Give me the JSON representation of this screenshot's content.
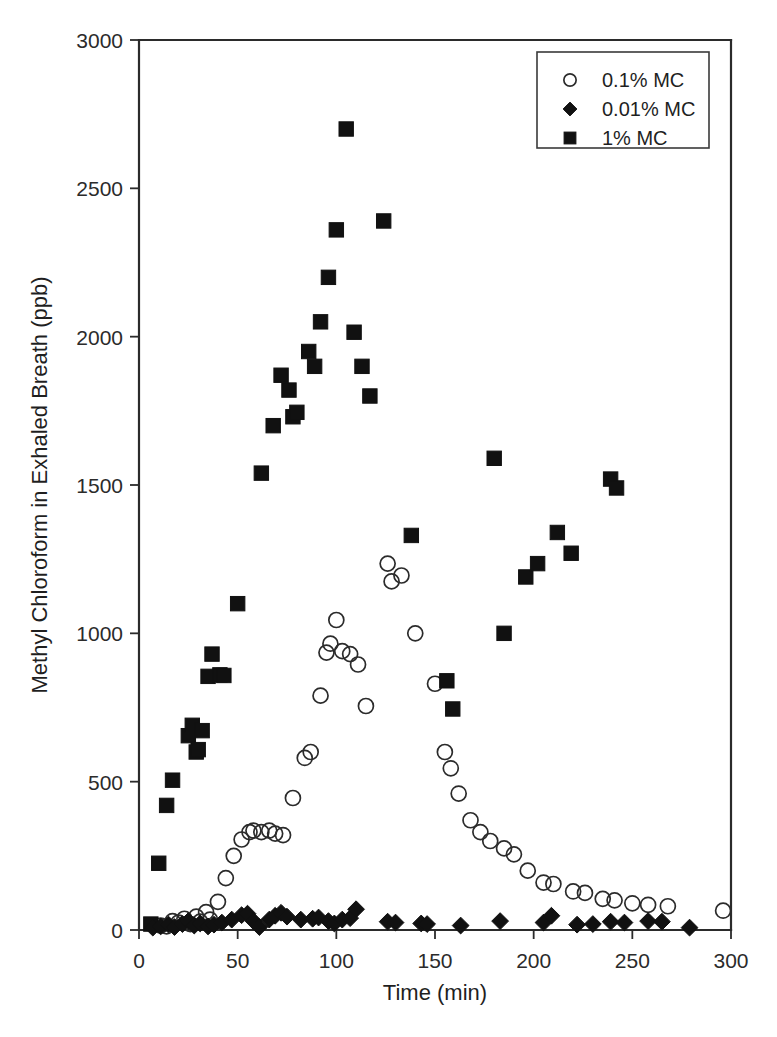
{
  "chart_data": {
    "type": "scatter",
    "title": "",
    "xlabel": "Time (min)",
    "ylabel": "Methyl Chloroform in Exhaled Breath (ppb)",
    "xlim": [
      0,
      300
    ],
    "ylim": [
      0,
      3000
    ],
    "xticks": [
      0,
      50,
      100,
      150,
      200,
      250,
      300
    ],
    "yticks": [
      0,
      500,
      1000,
      1500,
      2000,
      2500,
      3000
    ],
    "xtick_labels": [
      "0",
      "50",
      "100",
      "150",
      "200",
      "250",
      "300"
    ],
    "ytick_labels": [
      "0",
      "500",
      "1000",
      "1500",
      "2000",
      "2500",
      "3000"
    ],
    "grid": false,
    "legend_position": "top-right",
    "series": [
      {
        "name": "0.1% MC",
        "marker": "open-circle",
        "color": "#2b2b2b",
        "points": [
          [
            11,
            15
          ],
          [
            14,
            12
          ],
          [
            17,
            30
          ],
          [
            20,
            25
          ],
          [
            23,
            38
          ],
          [
            26,
            20
          ],
          [
            29,
            45
          ],
          [
            31,
            28
          ],
          [
            34,
            60
          ],
          [
            36,
            35
          ],
          [
            40,
            95
          ],
          [
            44,
            175
          ],
          [
            48,
            250
          ],
          [
            52,
            305
          ],
          [
            56,
            330
          ],
          [
            58,
            335
          ],
          [
            62,
            330
          ],
          [
            66,
            335
          ],
          [
            69,
            325
          ],
          [
            73,
            320
          ],
          [
            78,
            445
          ],
          [
            84,
            580
          ],
          [
            87,
            600
          ],
          [
            92,
            790
          ],
          [
            95,
            935
          ],
          [
            97,
            965
          ],
          [
            100,
            1045
          ],
          [
            103,
            940
          ],
          [
            107,
            930
          ],
          [
            111,
            895
          ],
          [
            115,
            755
          ],
          [
            126,
            1235
          ],
          [
            128,
            1175
          ],
          [
            133,
            1195
          ],
          [
            140,
            1000
          ],
          [
            150,
            830
          ],
          [
            155,
            600
          ],
          [
            158,
            545
          ],
          [
            162,
            460
          ],
          [
            168,
            370
          ],
          [
            173,
            330
          ],
          [
            178,
            300
          ],
          [
            185,
            275
          ],
          [
            190,
            255
          ],
          [
            197,
            200
          ],
          [
            205,
            160
          ],
          [
            210,
            155
          ],
          [
            220,
            130
          ],
          [
            226,
            125
          ],
          [
            235,
            105
          ],
          [
            241,
            100
          ],
          [
            250,
            90
          ],
          [
            258,
            85
          ],
          [
            268,
            80
          ],
          [
            296,
            65
          ]
        ]
      },
      {
        "name": "0.01% MC",
        "marker": "filled-diamond",
        "color": "#111111",
        "points": [
          [
            7,
            8
          ],
          [
            11,
            12
          ],
          [
            15,
            18
          ],
          [
            18,
            10
          ],
          [
            22,
            20
          ],
          [
            25,
            30
          ],
          [
            28,
            15
          ],
          [
            31,
            22
          ],
          [
            35,
            12
          ],
          [
            38,
            18
          ],
          [
            42,
            25
          ],
          [
            47,
            35
          ],
          [
            52,
            50
          ],
          [
            55,
            55
          ],
          [
            58,
            30
          ],
          [
            61,
            10
          ],
          [
            66,
            35
          ],
          [
            69,
            48
          ],
          [
            72,
            58
          ],
          [
            75,
            45
          ],
          [
            82,
            35
          ],
          [
            88,
            38
          ],
          [
            91,
            42
          ],
          [
            96,
            30
          ],
          [
            99,
            22
          ],
          [
            103,
            35
          ],
          [
            107,
            40
          ],
          [
            110,
            70
          ],
          [
            126,
            28
          ],
          [
            130,
            25
          ],
          [
            143,
            22
          ],
          [
            146,
            20
          ],
          [
            163,
            15
          ],
          [
            183,
            30
          ],
          [
            205,
            25
          ],
          [
            209,
            48
          ],
          [
            222,
            18
          ],
          [
            230,
            20
          ],
          [
            239,
            28
          ],
          [
            246,
            25
          ],
          [
            258,
            30
          ],
          [
            265,
            28
          ],
          [
            279,
            8
          ]
        ]
      },
      {
        "name": "1% MC",
        "marker": "filled-square",
        "color": "#111111",
        "points": [
          [
            6,
            20
          ],
          [
            10,
            225
          ],
          [
            14,
            420
          ],
          [
            17,
            505
          ],
          [
            25,
            655
          ],
          [
            27,
            690
          ],
          [
            29,
            600
          ],
          [
            30,
            608
          ],
          [
            32,
            672
          ],
          [
            35,
            855
          ],
          [
            37,
            930
          ],
          [
            41,
            860
          ],
          [
            43,
            858
          ],
          [
            50,
            1100
          ],
          [
            62,
            1540
          ],
          [
            68,
            1700
          ],
          [
            72,
            1870
          ],
          [
            76,
            1820
          ],
          [
            78,
            1730
          ],
          [
            80,
            1745
          ],
          [
            86,
            1950
          ],
          [
            89,
            1900
          ],
          [
            92,
            2050
          ],
          [
            96,
            2200
          ],
          [
            100,
            2360
          ],
          [
            105,
            2700
          ],
          [
            109,
            2015
          ],
          [
            113,
            1900
          ],
          [
            117,
            1800
          ],
          [
            124,
            2390
          ],
          [
            138,
            1330
          ],
          [
            156,
            840
          ],
          [
            159,
            745
          ],
          [
            180,
            1590
          ],
          [
            185,
            1000
          ],
          [
            196,
            1190
          ],
          [
            202,
            1235
          ],
          [
            212,
            1340
          ],
          [
            219,
            1270
          ],
          [
            239,
            1520
          ],
          [
            242,
            1490
          ]
        ]
      }
    ]
  },
  "legend": {
    "entries": [
      {
        "label": "0.1% MC",
        "marker": "open-circle"
      },
      {
        "label": "0.01% MC",
        "marker": "filled-diamond"
      },
      {
        "label": "1% MC",
        "marker": "filled-square"
      }
    ]
  },
  "axes": {
    "x_title": "Time (min)",
    "y_title": "Methyl Chloroform in Exhaled Breath (ppb)"
  }
}
